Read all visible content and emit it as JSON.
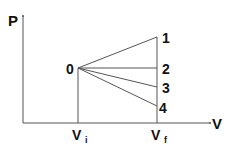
{
  "diagram": {
    "type": "pv-diagram",
    "axes": {
      "y_label": "P",
      "x_label": "V"
    },
    "start_point": {
      "label": "0"
    },
    "volume_labels": {
      "initial": "V",
      "initial_sub": "i",
      "final": "V",
      "final_sub": "f"
    },
    "end_points": [
      {
        "label": "1"
      },
      {
        "label": "2"
      },
      {
        "label": "3"
      },
      {
        "label": "4"
      }
    ],
    "colors": {
      "line": "#555555",
      "text": "#111111"
    }
  }
}
